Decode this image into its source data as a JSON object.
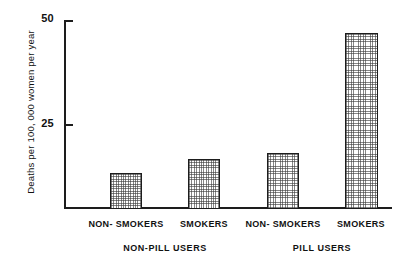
{
  "chart_data": {
    "type": "bar",
    "title": "",
    "subtitle": "",
    "xlabel": "",
    "ylabel": "Deaths per 100, 000 women per year",
    "categories": [
      "NON- SMOKERS",
      "SMOKERS",
      "NON- SMOKERS",
      "SMOKERS"
    ],
    "values": [
      8.3,
      11.9,
      13.3,
      46.7
    ],
    "groups": [
      {
        "label": "NON-PILL USERS",
        "categories": [
          "NON- SMOKERS",
          "SMOKERS"
        ],
        "values": [
          8.3,
          11.9
        ]
      },
      {
        "label": "PILL USERS",
        "categories": [
          "NON- SMOKERS",
          "SMOKERS"
        ],
        "values": [
          13.3,
          46.7
        ]
      }
    ],
    "group_labels": [
      "NON-PILL USERS",
      "PILL USERS"
    ],
    "ylim": [
      0,
      50
    ],
    "yticks": [
      25,
      50
    ],
    "ytick_labels": [
      "25",
      "50"
    ],
    "grid": false,
    "legend": null,
    "bar_fill": "gray crosshatch",
    "colors": {
      "axis": "#1d1d1d",
      "bar_edge": "#1d1d1d",
      "bar_fill": "#9a9a9a",
      "background": "#ffffff"
    }
  },
  "axis": {
    "ytick_50": "50",
    "ytick_25": "25",
    "ylabel": "Deaths per 100, 000 women per year"
  },
  "bars": [
    {
      "id": "bar-nonpill-nonsmokers",
      "label": "NON- SMOKERS",
      "value": 8.3,
      "left": 46,
      "width": 32,
      "height_px": 36
    },
    {
      "id": "bar-nonpill-smokers",
      "label": "SMOKERS",
      "value": 11.9,
      "left": 124,
      "width": 32,
      "height_px": 50
    },
    {
      "id": "bar-pill-nonsmokers",
      "label": "NON- SMOKERS",
      "value": 13.3,
      "left": 203,
      "width": 32,
      "height_px": 56
    },
    {
      "id": "bar-pill-smokers",
      "label": "SMOKERS",
      "value": 46.7,
      "left": 281,
      "width": 33,
      "height_px": 176
    }
  ],
  "category_labels": [
    {
      "text": "NON- SMOKERS",
      "center": 126
    },
    {
      "text": "SMOKERS",
      "center": 204
    },
    {
      "text": "NON- SMOKERS",
      "center": 283
    },
    {
      "text": "SMOKERS",
      "center": 361
    }
  ],
  "group_labels": [
    {
      "text": "NON-PILL USERS",
      "center": 165
    },
    {
      "text": "PILL USERS",
      "center": 322
    }
  ]
}
